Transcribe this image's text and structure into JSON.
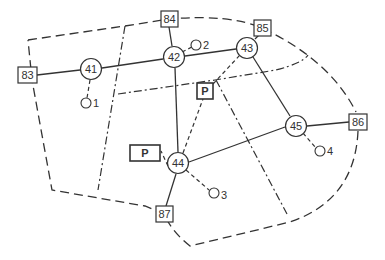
{
  "diagram": {
    "type": "network-map",
    "colors": {
      "stroke": "#333333",
      "background": "#ffffff",
      "text": "#333333"
    },
    "intersections": [
      {
        "id": "41",
        "label": "41",
        "x": 91,
        "y": 69
      },
      {
        "id": "42",
        "label": "42",
        "x": 174,
        "y": 57
      },
      {
        "id": "43",
        "label": "43",
        "x": 247,
        "y": 48
      },
      {
        "id": "44",
        "label": "44",
        "x": 178,
        "y": 163
      },
      {
        "id": "45",
        "label": "45",
        "x": 296,
        "y": 126
      }
    ],
    "boundary_nodes": [
      {
        "id": "83",
        "label": "83",
        "x": 28,
        "y": 75
      },
      {
        "id": "84",
        "label": "84",
        "x": 169,
        "y": 19
      },
      {
        "id": "85",
        "label": "85",
        "x": 262,
        "y": 28
      },
      {
        "id": "86",
        "label": "86",
        "x": 358,
        "y": 122
      },
      {
        "id": "87",
        "label": "87",
        "x": 164,
        "y": 214
      }
    ],
    "sub_nodes": [
      {
        "id": "1",
        "label": "1",
        "x": 86,
        "y": 103,
        "parent": "41"
      },
      {
        "id": "2",
        "label": "2",
        "x": 196,
        "y": 45,
        "parent": "42"
      },
      {
        "id": "3",
        "label": "3",
        "x": 214,
        "y": 193,
        "parent": "44"
      },
      {
        "id": "4",
        "label": "4",
        "x": 320,
        "y": 151,
        "parent": "45"
      }
    ],
    "parking": [
      {
        "id": "P1",
        "label": "P",
        "x": 205,
        "y": 91,
        "w": 16,
        "h": 15,
        "connects": "44"
      },
      {
        "id": "P2",
        "label": "P",
        "x": 145,
        "y": 152,
        "w": 30,
        "h": 16,
        "connects": "44"
      }
    ],
    "links": [
      [
        "83",
        "41"
      ],
      [
        "41",
        "42"
      ],
      [
        "42",
        "43"
      ],
      [
        "84",
        "42"
      ],
      [
        "43",
        "85"
      ],
      [
        "42",
        "44"
      ],
      [
        "43",
        "45"
      ],
      [
        "44",
        "45"
      ],
      [
        "45",
        "86"
      ],
      [
        "44",
        "87"
      ]
    ],
    "dashed_links": [
      [
        "41",
        "1"
      ],
      [
        "42",
        "2"
      ],
      [
        "44",
        "3"
      ],
      [
        "45",
        "4"
      ],
      [
        "44",
        "P1"
      ],
      [
        "44",
        "P2"
      ],
      [
        "P1",
        "43"
      ]
    ]
  }
}
